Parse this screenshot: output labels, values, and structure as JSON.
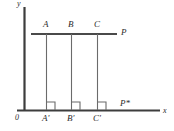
{
  "figure": {
    "type": "geometry-diagram",
    "background_color": "#ffffff",
    "stroke_color": "#4a4a4a",
    "axis_color": "#3d3d3d",
    "label_color": "#2b2b2b",
    "axes": {
      "y_axis_label": "y",
      "x_axis_label": "x",
      "origin_label": "0"
    },
    "lines": {
      "upper_line_label": "P",
      "lower_line_label": "P*"
    },
    "points_upper": [
      {
        "label": "A",
        "x": 46
      },
      {
        "label": "B",
        "x": 71
      },
      {
        "label": "C",
        "x": 97
      }
    ],
    "points_lower": [
      {
        "label": "A'",
        "x": 46
      },
      {
        "label": "B'",
        "x": 71
      },
      {
        "label": "C'",
        "x": 97
      }
    ],
    "geometry": {
      "y_axis_x": 24,
      "y_axis_top": 7,
      "x_axis_y": 111,
      "x_axis_left": 17,
      "x_axis_right": 160,
      "upper_line_y": 34,
      "upper_line_left": 31,
      "upper_line_right": 117,
      "right_angle_size": 8
    }
  }
}
